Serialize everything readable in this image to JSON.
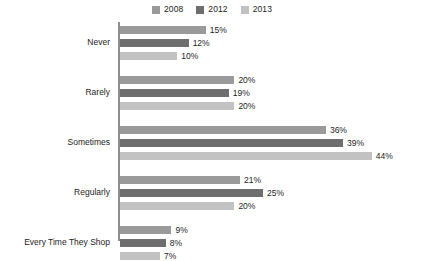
{
  "chart_data": {
    "type": "bar",
    "orientation": "horizontal",
    "title": "",
    "xlabel": "",
    "ylabel": "",
    "grid": false,
    "legend_position": "top-center",
    "xlim": [
      0,
      44
    ],
    "value_suffix": "%",
    "categories": [
      "Never",
      "Rarely",
      "Sometimes",
      "Regularly",
      "Every Time They Shop"
    ],
    "series": [
      {
        "name": "2008",
        "color": "#9a9a9a",
        "values": [
          15,
          20,
          36,
          21,
          9
        ],
        "labels": [
          "15%",
          "20%",
          "36%",
          "21%",
          "9%"
        ]
      },
      {
        "name": "2012",
        "color": "#6e6e6e",
        "values": [
          12,
          19,
          39,
          25,
          8
        ],
        "labels": [
          "12%",
          "19%",
          "39%",
          "25%",
          "8%"
        ]
      },
      {
        "name": "2013",
        "color": "#c2c2c2",
        "values": [
          10,
          20,
          44,
          20,
          7
        ],
        "labels": [
          "10%",
          "20%",
          "44%",
          "20%",
          "7%"
        ]
      }
    ]
  },
  "colors": {
    "background": "#ffffff",
    "axis": "#8e8e8e",
    "text": "#1d1d1d"
  }
}
